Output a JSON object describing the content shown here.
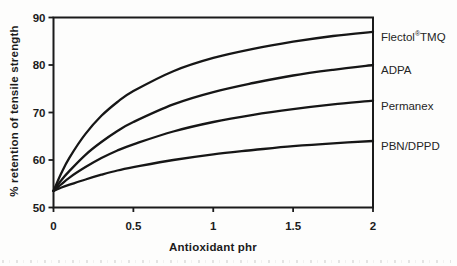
{
  "figure": {
    "background": "#fdfdfc",
    "ink_color": "#1b1b1b",
    "curve_color": "#161616"
  },
  "chart_data": {
    "type": "line",
    "title": "",
    "xlabel": "Antioxidant phr",
    "ylabel": "% retention of tensile strength",
    "xlim": [
      0,
      2
    ],
    "ylim": [
      50,
      90
    ],
    "xticks": [
      0,
      0.5,
      1,
      1.5,
      2
    ],
    "xtick_labels": [
      "0",
      "0.5",
      "1",
      "1.5",
      "2"
    ],
    "yticks": [
      50,
      60,
      70,
      80,
      90
    ],
    "ytick_labels": [
      "50",
      "60",
      "70",
      "80",
      "90"
    ],
    "grid": false,
    "legend_position": "labels-right-outside",
    "x_samples": [
      0,
      0.05,
      0.1,
      0.2,
      0.3,
      0.4,
      0.5,
      0.75,
      1,
      1.25,
      1.5,
      1.75,
      2
    ],
    "series": [
      {
        "name": "Flectol®TMQ",
        "values": [
          53.5,
          57.3,
          60.5,
          65.5,
          69.3,
          72.2,
          74.5,
          78.7,
          81.5,
          83.4,
          84.9,
          86.1,
          87.0
        ]
      },
      {
        "name": "ADPA",
        "values": [
          53.5,
          55.8,
          57.7,
          61.1,
          63.8,
          66.1,
          68.0,
          71.7,
          74.3,
          76.2,
          77.8,
          79.0,
          80.0
        ]
      },
      {
        "name": "Permanex",
        "values": [
          53.5,
          54.9,
          56.3,
          58.5,
          60.4,
          62.0,
          63.3,
          66.0,
          68.0,
          69.5,
          70.7,
          71.7,
          72.5
        ]
      },
      {
        "name": "PBN/DPPD",
        "values": [
          53.5,
          54.2,
          54.8,
          55.9,
          56.9,
          57.8,
          58.5,
          60.0,
          61.2,
          62.1,
          62.9,
          63.5,
          64.0
        ]
      }
    ]
  }
}
